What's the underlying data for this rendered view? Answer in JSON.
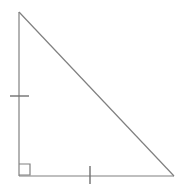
{
  "figure": {
    "name": "right-triangle",
    "description": "Right triangle with right angle marker at bottom-left and congruence tick marks on the vertical leg and the horizontal leg",
    "canvas": {
      "width": 177,
      "height": 185,
      "background_color": "#ffffff"
    },
    "style": {
      "line_color": "#808080",
      "line_width": 1.2,
      "tick_color": "#707070",
      "tick_width": 1.4,
      "right_angle_color": "#808080",
      "right_angle_width": 1.2
    },
    "vertices": {
      "apex": {
        "label": "apex",
        "x": 19,
        "y": 12
      },
      "right_angle": {
        "label": "right-angle-vertex",
        "x": 19,
        "y": 176
      },
      "right": {
        "label": "right-vertex",
        "x": 174,
        "y": 176
      }
    },
    "sides": [
      {
        "name": "vertical-leg",
        "from": "apex",
        "to": "right_angle",
        "x1": 19,
        "y1": 12,
        "x2": 19,
        "y2": 176,
        "tick_count": 1
      },
      {
        "name": "horizontal-leg",
        "from": "right_angle",
        "to": "right",
        "x1": 19,
        "y1": 176,
        "x2": 174,
        "y2": 176,
        "tick_count": 1
      },
      {
        "name": "hypotenuse",
        "from": "apex",
        "to": "right",
        "x1": 19,
        "y1": 12,
        "x2": 174,
        "y2": 176,
        "tick_count": 0
      }
    ],
    "tick_marks": [
      {
        "name": "vertical-leg-tick",
        "orientation": "horizontal",
        "x1": 10,
        "y1": 96,
        "x2": 29,
        "y2": 96
      },
      {
        "name": "horizontal-leg-tick",
        "orientation": "vertical",
        "x1": 90,
        "y1": 166,
        "x2": 90,
        "y2": 184
      }
    ],
    "right_angle_marker": {
      "name": "right-angle-square",
      "x": 19,
      "y": 164,
      "size": 11,
      "path": "M 19 164 L 30 164 L 30 175 L 19 175"
    },
    "labels": []
  }
}
